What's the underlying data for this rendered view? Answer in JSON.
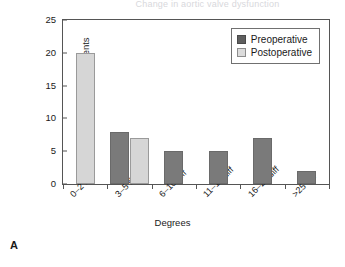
{
  "figure": {
    "panel_label": "A",
    "cropped_title": "Change in aortic valve dysfunction"
  },
  "legend": {
    "position": "top-right",
    "entries": [
      {
        "label": "Preoperative",
        "color": "#5f5f5f",
        "icon": "square-swatch-dark"
      },
      {
        "label": "Postoperative",
        "color": "#dcdcdc",
        "icon": "square-swatch-light"
      }
    ]
  },
  "chart_data": {
    "type": "bar",
    "title": "Change in aortic valve dysfunction",
    "xlabel": "Degrees",
    "ylabel": "Number of patients",
    "categories": [
      "0–2 diff",
      "3–5 diff",
      "6–10 diff",
      "11–15 diff",
      "16–25 diff",
      ">25 diff"
    ],
    "series": [
      {
        "name": "Preoperative",
        "color": "#7a7a7a",
        "values": [
          0,
          8,
          5,
          5,
          7,
          2
        ]
      },
      {
        "name": "Postoperative",
        "color": "#d6d6d6",
        "values": [
          20,
          7,
          0,
          0,
          0,
          0
        ]
      }
    ],
    "ylim": [
      0,
      25
    ],
    "yticks": [
      0,
      5,
      10,
      15,
      20,
      25
    ],
    "grid": false,
    "legend_position": "top-right"
  }
}
